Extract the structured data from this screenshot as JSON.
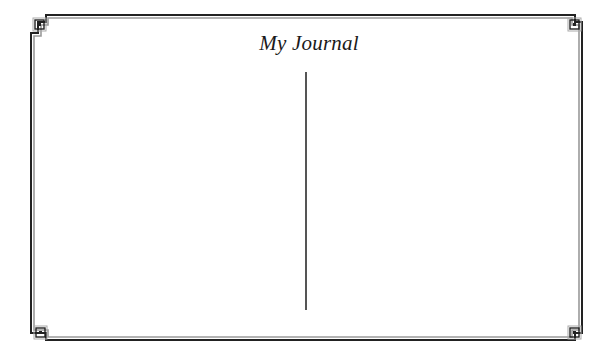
{
  "journal": {
    "title": "My Journal",
    "left_page": {
      "content": ""
    },
    "right_page": {
      "content": ""
    }
  },
  "frame": {
    "outer_line_color": "#222222",
    "inner_line_color": "#9a9a9a",
    "corner_ornament": "greek-key-step-icon"
  },
  "divider": {
    "color": "#555555"
  }
}
